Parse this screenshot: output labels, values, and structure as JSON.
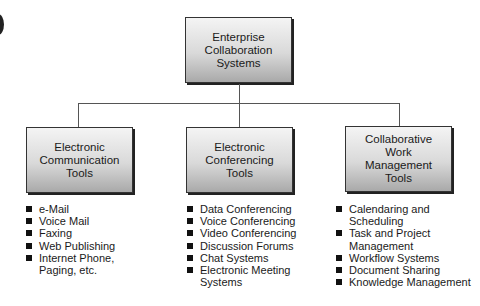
{
  "diagram": {
    "root": {
      "label": "Enterprise Collaboration Systems",
      "lines": [
        "Enterprise",
        "Collaboration",
        "Systems"
      ]
    },
    "branches": [
      {
        "label": "Electronic Communication Tools",
        "lines": [
          "Electronic",
          "Communication",
          "Tools"
        ],
        "items": [
          "e-Mail",
          "Voice Mail",
          "Faxing",
          "Web Publishing",
          "Internet Phone, Paging, etc."
        ]
      },
      {
        "label": "Electronic Conferencing Tools",
        "lines": [
          "Electronic",
          "Conferencing",
          "Tools"
        ],
        "items": [
          "Data Conferencing",
          "Voice Conferencing",
          "Video Conferencing",
          "Discussion Forums",
          "Chat Systems",
          "Electronic Meeting Systems"
        ]
      },
      {
        "label": "Collaborative Work Management Tools",
        "lines": [
          "Collaborative",
          "Work",
          "Management",
          "Tools"
        ],
        "items": [
          "Calendaring and Scheduling",
          "Task and Project Management",
          "Workflow Systems",
          "Document Sharing",
          "Knowledge Management"
        ]
      }
    ]
  },
  "colors": {
    "box_top": "#f4f4f4",
    "box_bottom": "#a9a9a9",
    "line": "#555555"
  }
}
